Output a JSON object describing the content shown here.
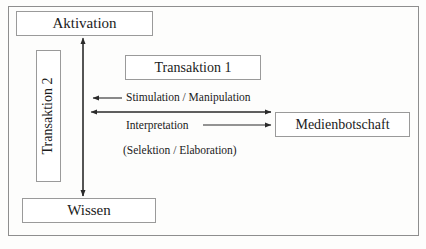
{
  "diagram": {
    "title_text": "",
    "frame": {
      "name": "outer-frame",
      "border_color": "#8e8e8e"
    },
    "nodes": [
      {
        "id": "aktivation",
        "label": "Aktivation",
        "orientation": "horizontal"
      },
      {
        "id": "transaktion2",
        "label": "Transaktion 2",
        "orientation": "vertical"
      },
      {
        "id": "transaktion1",
        "label": "Transaktion 1",
        "orientation": "horizontal"
      },
      {
        "id": "medienbotschaft",
        "label": "Medienbotschaft",
        "orientation": "horizontal"
      },
      {
        "id": "wissen",
        "label": "Wissen",
        "orientation": "horizontal"
      }
    ],
    "captions": [
      {
        "id": "stimulation",
        "text": "Stimulation / Manipulation"
      },
      {
        "id": "interpretation",
        "text": "Interpretation"
      },
      {
        "id": "selektion",
        "text": "(Selektion / Elaboration)"
      }
    ],
    "arrows": [
      {
        "id": "vertical-aktivation-wissen",
        "direction": "double",
        "orientation": "vertical",
        "from": "wissen",
        "to": "aktivation"
      },
      {
        "id": "stimulation-arrow",
        "direction": "left",
        "orientation": "horizontal",
        "label": "Stimulation / Manipulation"
      },
      {
        "id": "long-double-arrow",
        "direction": "double",
        "orientation": "horizontal"
      },
      {
        "id": "interpretation-arrow",
        "direction": "right",
        "orientation": "horizontal",
        "label": "Interpretation"
      }
    ],
    "colors": {
      "background": "#fdfdfc",
      "frame_border": "#8e8e8e",
      "node_border": "#9a9a9a",
      "node_fill": "#ffffff",
      "text": "#1b1b1b",
      "arrow": "#2a2a2a"
    }
  }
}
